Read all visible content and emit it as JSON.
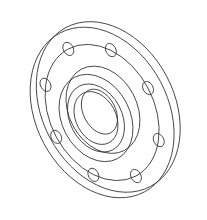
{
  "figure": {
    "stroke_color": "#333333",
    "background": "#ffffff",
    "bolt_hole_count": 8
  }
}
